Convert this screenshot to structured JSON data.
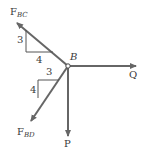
{
  "diagram": {
    "type": "free-body-diagram",
    "point": {
      "label": "B"
    },
    "forces": [
      {
        "id": "F_BC",
        "symbol": "F",
        "subscript": "BC",
        "direction": "up-left",
        "slope": {
          "rise": "3",
          "run": "4"
        }
      },
      {
        "id": "F_BD",
        "symbol": "F",
        "subscript": "BD",
        "direction": "down-left",
        "slope": {
          "rise": "4",
          "run": "3"
        }
      },
      {
        "id": "Q",
        "symbol": "Q",
        "direction": "right"
      },
      {
        "id": "P",
        "symbol": "P",
        "direction": "down"
      }
    ],
    "colors": {
      "arrow": "#666666",
      "triangle": "#555555",
      "text": "#3a3a3a"
    }
  }
}
